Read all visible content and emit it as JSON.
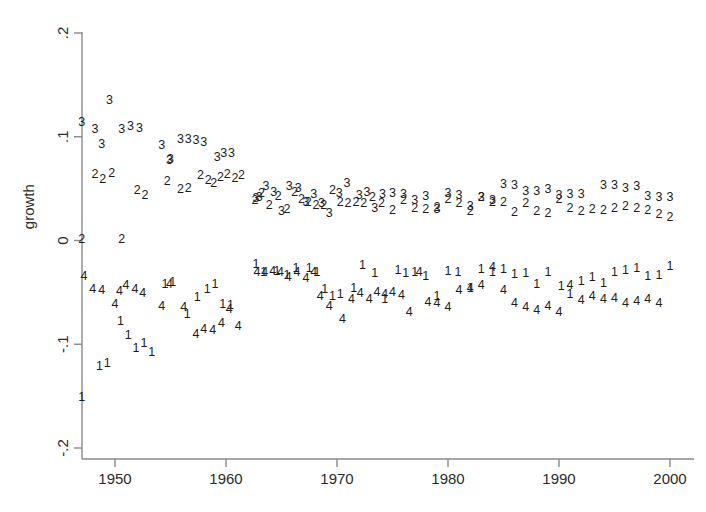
{
  "chart_data": {
    "type": "scatter",
    "title": "",
    "subtitle": "",
    "xlabel": "",
    "ylabel": "growth",
    "xlim": [
      1946.2,
      2000.8
    ],
    "ylim": [
      -0.2,
      0.2
    ],
    "xticks": [
      1950,
      1960,
      1970,
      1980,
      1990,
      2000
    ],
    "xticklabels": [
      "1950",
      "1960",
      "1970",
      "1980",
      "1990",
      "2000"
    ],
    "yticks": [
      0.2,
      0.1,
      0,
      -0.1,
      -0.2
    ],
    "yticklabels": [
      ".2",
      ".1",
      "0",
      "-.1",
      "-.2"
    ],
    "grid": false,
    "legend": "none",
    "marker_style": "series-number-glyph",
    "series": [
      {
        "name": "1",
        "label": "1",
        "marker": "1",
        "points": [
          [
            1947.0,
            -0.152
          ],
          [
            1948.6,
            -0.122
          ],
          [
            1949.3,
            -0.119
          ],
          [
            1950.5,
            -0.078
          ],
          [
            1951.2,
            -0.092
          ],
          [
            1951.9,
            -0.104
          ],
          [
            1952.6,
            -0.099
          ],
          [
            1953.3,
            -0.108
          ],
          [
            1954.5,
            -0.043
          ],
          [
            1955.2,
            -0.041
          ],
          [
            1956.5,
            -0.072
          ],
          [
            1957.4,
            -0.055
          ],
          [
            1958.3,
            -0.047
          ],
          [
            1959.0,
            -0.043
          ],
          [
            1959.7,
            -0.062
          ],
          [
            1960.4,
            -0.063
          ],
          [
            1962.7,
            -0.023
          ],
          [
            1963.4,
            -0.031
          ],
          [
            1964.6,
            -0.03
          ],
          [
            1965.5,
            -0.034
          ],
          [
            1966.3,
            -0.027
          ],
          [
            1967.5,
            -0.027
          ],
          [
            1968.2,
            -0.031
          ],
          [
            1968.9,
            -0.047
          ],
          [
            1969.6,
            -0.054
          ],
          [
            1970.3,
            -0.052
          ],
          [
            1971.5,
            -0.046
          ],
          [
            1972.3,
            -0.024
          ],
          [
            1973.4,
            -0.032
          ],
          [
            1974.3,
            -0.057
          ],
          [
            1975.5,
            -0.029
          ],
          [
            1976.2,
            -0.032
          ],
          [
            1977.0,
            -0.031
          ],
          [
            1978.0,
            -0.035
          ],
          [
            1979.0,
            -0.054
          ],
          [
            1980.0,
            -0.03
          ],
          [
            1980.9,
            -0.031
          ],
          [
            1982.0,
            -0.046
          ],
          [
            1983.0,
            -0.028
          ],
          [
            1984.0,
            -0.031
          ],
          [
            1985.0,
            -0.028
          ],
          [
            1986.0,
            -0.033
          ],
          [
            1987.0,
            -0.032
          ],
          [
            1988.0,
            -0.043
          ],
          [
            1989.0,
            -0.031
          ],
          [
            1990.2,
            -0.045
          ],
          [
            1991.0,
            -0.052
          ],
          [
            1992.0,
            -0.04
          ],
          [
            1993.0,
            -0.036
          ],
          [
            1994.0,
            -0.042
          ],
          [
            1995.0,
            -0.031
          ],
          [
            1996.0,
            -0.029
          ],
          [
            1997.0,
            -0.027
          ],
          [
            1998.0,
            -0.035
          ],
          [
            1999.0,
            -0.034
          ],
          [
            2000.0,
            -0.025
          ]
        ]
      },
      {
        "name": "2",
        "label": "2",
        "marker": "2",
        "points": [
          [
            1947.0,
            0.001
          ],
          [
            1948.2,
            0.063
          ],
          [
            1948.9,
            0.059
          ],
          [
            1949.7,
            0.064
          ],
          [
            1950.6,
            0.001
          ],
          [
            1952.0,
            0.048
          ],
          [
            1952.7,
            0.043
          ],
          [
            1954.7,
            0.057
          ],
          [
            1955.9,
            0.049
          ],
          [
            1956.6,
            0.05
          ],
          [
            1957.7,
            0.062
          ],
          [
            1958.4,
            0.058
          ],
          [
            1958.9,
            0.055
          ],
          [
            1959.5,
            0.061
          ],
          [
            1960.1,
            0.063
          ],
          [
            1960.8,
            0.06
          ],
          [
            1961.4,
            0.062
          ],
          [
            1962.6,
            0.038
          ],
          [
            1963.2,
            0.045
          ],
          [
            1963.9,
            0.034
          ],
          [
            1964.7,
            0.042
          ],
          [
            1965.5,
            0.03
          ],
          [
            1966.2,
            0.046
          ],
          [
            1966.8,
            0.039
          ],
          [
            1967.4,
            0.036
          ],
          [
            1968.1,
            0.034
          ],
          [
            1968.8,
            0.034
          ],
          [
            1969.6,
            0.048
          ],
          [
            1970.3,
            0.036
          ],
          [
            1971.0,
            0.035
          ],
          [
            1971.7,
            0.036
          ],
          [
            1972.4,
            0.035
          ],
          [
            1973.2,
            0.041
          ],
          [
            1974.0,
            0.035
          ],
          [
            1975.0,
            0.029
          ],
          [
            1976.0,
            0.038
          ],
          [
            1977.0,
            0.031
          ],
          [
            1978.0,
            0.03
          ],
          [
            1979.0,
            0.032
          ],
          [
            1980.0,
            0.039
          ],
          [
            1981.0,
            0.035
          ],
          [
            1982.0,
            0.028
          ],
          [
            1983.0,
            0.041
          ],
          [
            1984.0,
            0.036
          ],
          [
            1985.0,
            0.036
          ],
          [
            1986.0,
            0.027
          ],
          [
            1987.0,
            0.035
          ],
          [
            1988.0,
            0.028
          ],
          [
            1989.0,
            0.026
          ],
          [
            1990.0,
            0.039
          ],
          [
            1991.0,
            0.031
          ],
          [
            1992.0,
            0.028
          ],
          [
            1993.0,
            0.03
          ],
          [
            1994.0,
            0.029
          ],
          [
            1995.0,
            0.031
          ],
          [
            1996.0,
            0.033
          ],
          [
            1997.0,
            0.031
          ],
          [
            1998.0,
            0.029
          ],
          [
            1999.0,
            0.025
          ],
          [
            2000.0,
            0.022
          ]
        ]
      },
      {
        "name": "3",
        "label": "3",
        "marker": "3",
        "points": [
          [
            1947.0,
            0.114
          ],
          [
            1948.2,
            0.107
          ],
          [
            1948.8,
            0.092
          ],
          [
            1949.5,
            0.135
          ],
          [
            1950.6,
            0.107
          ],
          [
            1951.4,
            0.11
          ],
          [
            1952.2,
            0.108
          ],
          [
            1954.2,
            0.091
          ],
          [
            1954.9,
            0.077
          ],
          [
            1955.0,
            0.078
          ],
          [
            1955.9,
            0.097
          ],
          [
            1956.6,
            0.097
          ],
          [
            1957.3,
            0.096
          ],
          [
            1958.0,
            0.094
          ],
          [
            1959.2,
            0.08
          ],
          [
            1959.8,
            0.084
          ],
          [
            1960.5,
            0.084
          ],
          [
            1962.7,
            0.04
          ],
          [
            1963.0,
            0.041
          ],
          [
            1963.6,
            0.052
          ],
          [
            1964.3,
            0.046
          ],
          [
            1965.0,
            0.028
          ],
          [
            1965.7,
            0.052
          ],
          [
            1966.5,
            0.05
          ],
          [
            1967.2,
            0.036
          ],
          [
            1967.9,
            0.044
          ],
          [
            1968.6,
            0.035
          ],
          [
            1969.3,
            0.026
          ],
          [
            1970.2,
            0.045
          ],
          [
            1970.9,
            0.055
          ],
          [
            1972.0,
            0.043
          ],
          [
            1972.7,
            0.046
          ],
          [
            1973.4,
            0.031
          ],
          [
            1974.1,
            0.044
          ],
          [
            1975.0,
            0.045
          ],
          [
            1976.0,
            0.044
          ],
          [
            1977.0,
            0.038
          ],
          [
            1978.0,
            0.042
          ],
          [
            1979.0,
            0.03
          ],
          [
            1980.0,
            0.045
          ],
          [
            1981.0,
            0.043
          ],
          [
            1982.0,
            0.033
          ],
          [
            1983.0,
            0.041
          ],
          [
            1984.0,
            0.038
          ],
          [
            1985.0,
            0.054
          ],
          [
            1986.0,
            0.053
          ],
          [
            1987.0,
            0.047
          ],
          [
            1988.0,
            0.047
          ],
          [
            1989.0,
            0.049
          ],
          [
            1990.0,
            0.043
          ],
          [
            1991.0,
            0.044
          ],
          [
            1992.0,
            0.044
          ],
          [
            1994.0,
            0.053
          ],
          [
            1995.0,
            0.053
          ],
          [
            1996.0,
            0.05
          ],
          [
            1997.0,
            0.052
          ],
          [
            1998.0,
            0.042
          ],
          [
            1999.0,
            0.041
          ],
          [
            2000.0,
            0.041
          ]
        ]
      },
      {
        "name": "4",
        "label": "4",
        "marker": "4",
        "points": [
          [
            1947.2,
            -0.035
          ],
          [
            1948.0,
            -0.047
          ],
          [
            1948.8,
            -0.048
          ],
          [
            1950.0,
            -0.062
          ],
          [
            1950.4,
            -0.049
          ],
          [
            1951.0,
            -0.044
          ],
          [
            1951.8,
            -0.047
          ],
          [
            1952.5,
            -0.051
          ],
          [
            1954.2,
            -0.064
          ],
          [
            1954.9,
            -0.043
          ],
          [
            1956.2,
            -0.065
          ],
          [
            1957.3,
            -0.091
          ],
          [
            1958.0,
            -0.086
          ],
          [
            1958.8,
            -0.087
          ],
          [
            1959.6,
            -0.08
          ],
          [
            1960.3,
            -0.067
          ],
          [
            1961.1,
            -0.083
          ],
          [
            1962.8,
            -0.031
          ],
          [
            1963.5,
            -0.031
          ],
          [
            1964.2,
            -0.03
          ],
          [
            1964.9,
            -0.031
          ],
          [
            1965.6,
            -0.036
          ],
          [
            1966.4,
            -0.031
          ],
          [
            1967.2,
            -0.037
          ],
          [
            1967.9,
            -0.031
          ],
          [
            1968.5,
            -0.054
          ],
          [
            1969.3,
            -0.064
          ],
          [
            1970.5,
            -0.076
          ],
          [
            1971.3,
            -0.057
          ],
          [
            1972.1,
            -0.051
          ],
          [
            1972.9,
            -0.057
          ],
          [
            1973.6,
            -0.05
          ],
          [
            1974.3,
            -0.052
          ],
          [
            1975.0,
            -0.05
          ],
          [
            1975.8,
            -0.053
          ],
          [
            1976.5,
            -0.07
          ],
          [
            1977.4,
            -0.031
          ],
          [
            1978.2,
            -0.06
          ],
          [
            1979.0,
            -0.061
          ],
          [
            1980.0,
            -0.065
          ],
          [
            1981.0,
            -0.048
          ],
          [
            1982.0,
            -0.046
          ],
          [
            1983.0,
            -0.044
          ],
          [
            1984.0,
            -0.026
          ],
          [
            1985.0,
            -0.048
          ],
          [
            1986.0,
            -0.061
          ],
          [
            1987.0,
            -0.065
          ],
          [
            1988.0,
            -0.068
          ],
          [
            1989.0,
            -0.064
          ],
          [
            1990.0,
            -0.07
          ],
          [
            1991.0,
            -0.044
          ],
          [
            1992.0,
            -0.058
          ],
          [
            1993.0,
            -0.054
          ],
          [
            1994.0,
            -0.057
          ],
          [
            1995.0,
            -0.056
          ],
          [
            1996.0,
            -0.061
          ],
          [
            1997.0,
            -0.059
          ],
          [
            1998.0,
            -0.057
          ],
          [
            1999.0,
            -0.061
          ]
        ]
      }
    ]
  }
}
